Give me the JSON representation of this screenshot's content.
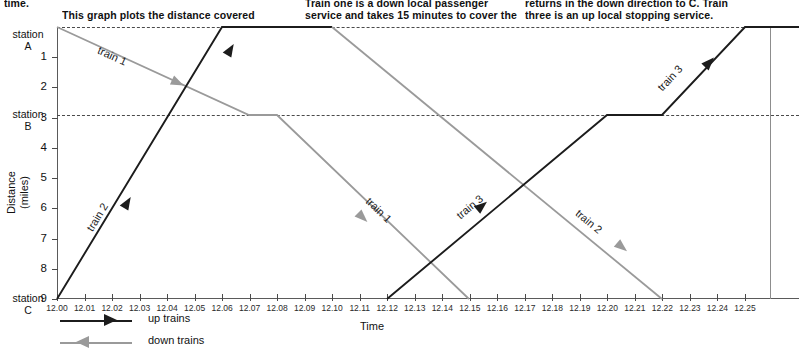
{
  "caption": {
    "column_a": [
      "time.",
      "This graph plots the distance covered"
    ],
    "column_b": [
      "Train one is a down local passenger",
      "service and takes 15 minutes to cover the"
    ],
    "column_c": [
      "returns in the down direction to C. Train",
      "three is an up local stopping service."
    ]
  },
  "axes": {
    "x_title": "Time",
    "y_title_line1": "Distance",
    "y_title_line2": "(miles)",
    "x_ticks": [
      "12.00",
      "12.01",
      "12.02",
      "12.03",
      "12.04",
      "12.05",
      "12.06",
      "12.07",
      "12.08",
      "12.09",
      "12.10",
      "12.11",
      "12.12",
      "12.13",
      "12.14",
      "12.15",
      "12.16",
      "12.17",
      "12.18",
      "12.19",
      "12.20",
      "12.21",
      "12.22",
      "12.23",
      "12.24",
      "12.25"
    ],
    "y_ticks": [
      "1",
      "2",
      "3",
      "4",
      "5",
      "6",
      "7",
      "8",
      "9"
    ],
    "stations": [
      {
        "name_line1": "station",
        "name_line2": "A",
        "distance": 0
      },
      {
        "name_line1": "station",
        "name_line2": "B",
        "distance": 3
      },
      {
        "name_line1": "station",
        "name_line2": "C",
        "distance": 9
      }
    ]
  },
  "legend": {
    "items": [
      {
        "label": "up trains",
        "direction": "right",
        "color": "#1c1c1c"
      },
      {
        "label": "down trains",
        "direction": "left",
        "color": "#9a9a9a"
      }
    ]
  },
  "train_labels": {
    "train1_a": "train 1",
    "train1_b": "train 1",
    "train2_a": "train 2",
    "train2_b": "train 2",
    "train3_a": "train 3",
    "train3_b": "train 3"
  },
  "colors": {
    "up_train": "#1c1c1c",
    "down_train": "#9a9a9a",
    "axis": "#5a5a5a",
    "guide": "#4a4a4a"
  },
  "chart_data": {
    "type": "line",
    "title": "",
    "xlabel": "Time",
    "ylabel": "Distance (miles)",
    "xlim": [
      "12.00",
      "12.25"
    ],
    "ylim": [
      0,
      9
    ],
    "y_inverted": true,
    "grid": false,
    "legend_position": "bottom-left",
    "station_lines": [
      {
        "station": "A",
        "distance": 0,
        "style": "dashed"
      },
      {
        "station": "B",
        "distance": 3,
        "style": "dashed"
      }
    ],
    "series": [
      {
        "name": "train 1",
        "direction": "down",
        "color": "#9a9a9a",
        "points": [
          {
            "time": "12.00",
            "distance": 0
          },
          {
            "time": "12.07",
            "distance": 3
          },
          {
            "time": "12.08",
            "distance": 3
          },
          {
            "time": "12.15",
            "distance": 9
          }
        ]
      },
      {
        "name": "train 2 (up)",
        "direction": "up",
        "color": "#1c1c1c",
        "points": [
          {
            "time": "12.00",
            "distance": 9
          },
          {
            "time": "12.06",
            "distance": 0
          },
          {
            "time": "12.10",
            "distance": 0
          }
        ]
      },
      {
        "name": "train 2 (down)",
        "direction": "down",
        "color": "#9a9a9a",
        "points": [
          {
            "time": "12.10",
            "distance": 0
          },
          {
            "time": "12.22",
            "distance": 9
          }
        ]
      },
      {
        "name": "train 3",
        "direction": "up",
        "color": "#1c1c1c",
        "points": [
          {
            "time": "12.12",
            "distance": 9
          },
          {
            "time": "12.20",
            "distance": 3
          },
          {
            "time": "12.22",
            "distance": 3
          },
          {
            "time": "12.25",
            "distance": 0
          },
          {
            "time": "12.26",
            "distance": 0
          }
        ]
      }
    ]
  }
}
